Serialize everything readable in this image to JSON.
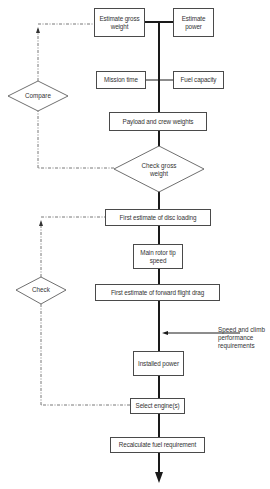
{
  "diagram": {
    "type": "flowchart",
    "nodes": {
      "estimate_gross_weight": "Estimate gross weight",
      "estimate_power": "Estimate power",
      "mission_time": "Mission time",
      "fuel_capacity": "Fuel capacity",
      "payload_crew": "Payload and crew weights",
      "check_gross_weight": "Check gross weight",
      "compare": "Compare",
      "disc_loading": "First estimate of disc loading",
      "rotor_tip_speed": "Main rotor tip speed",
      "check": "Check",
      "forward_drag": "First estimate of forward flight drag",
      "installed_power": "Installed power",
      "select_engines": "Select engine(s)",
      "recalc_fuel": "Recalculate fuel requirement"
    },
    "inputs": {
      "speed_climb": "Speed and climb performance requirements"
    },
    "colors": {
      "line": "#1a1a1a",
      "border": "#4a4a4a",
      "text": "#333333"
    }
  }
}
